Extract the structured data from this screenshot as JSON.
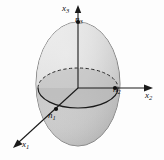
{
  "figure": {
    "background_color": "#fdfdfd",
    "ink_color": "#1a1a1a",
    "surface_light": "#e8e8e8",
    "surface_mid": "#c9c9c9",
    "surface_dark": "#a8a8a8",
    "equator_fill": "#b8b8b8"
  },
  "axes": [
    {
      "id": "x1",
      "label": "x",
      "subscript": "1",
      "direction": "down-left",
      "arrow": true,
      "from": [
        78,
        88
      ],
      "to": [
        14,
        147
      ]
    },
    {
      "id": "x2",
      "label": "x",
      "subscript": "2",
      "direction": "right",
      "arrow": true,
      "from": [
        78,
        88
      ],
      "to": [
        152,
        88
      ]
    },
    {
      "id": "x3",
      "label": "x",
      "subscript": "3",
      "direction": "up",
      "arrow": true,
      "from": [
        78,
        88
      ],
      "to": [
        78,
        8
      ]
    }
  ],
  "points": [
    {
      "id": "n1",
      "label": "n",
      "subscript": "1",
      "at": [
        55,
        110
      ],
      "marker": true
    },
    {
      "id": "n2",
      "label": "n",
      "subscript": "2",
      "at": [
        115,
        88
      ],
      "marker": true
    },
    {
      "id": "n3",
      "label": "n",
      "subscript": "3",
      "at": [
        78,
        22
      ],
      "marker": true
    }
  ],
  "ellipsoid": {
    "center": [
      78,
      84
    ],
    "semi_x": 42,
    "semi_y": 62,
    "equator": {
      "center": [
        78,
        88
      ],
      "semi_x": 40,
      "semi_y": 20,
      "back_style": "dashed",
      "front_style": "solid"
    }
  }
}
